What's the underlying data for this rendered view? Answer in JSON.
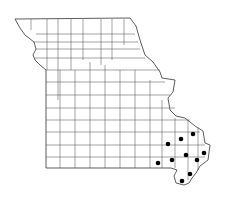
{
  "map": {
    "region": "Missouri",
    "subdivision": "county outlines",
    "outline_color": "#333333",
    "marker_color": "#000000",
    "markers": [
      {
        "x": 193,
        "y": 134
      },
      {
        "x": 181,
        "y": 139
      },
      {
        "x": 168,
        "y": 144
      },
      {
        "x": 186,
        "y": 155
      },
      {
        "x": 204,
        "y": 153
      },
      {
        "x": 197,
        "y": 160
      },
      {
        "x": 172,
        "y": 160
      },
      {
        "x": 158,
        "y": 163
      },
      {
        "x": 190,
        "y": 174
      },
      {
        "x": 182,
        "y": 181
      }
    ]
  }
}
